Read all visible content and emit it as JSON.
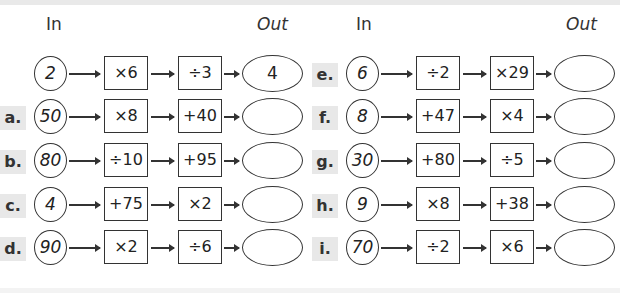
{
  "headers": {
    "left_in": "In",
    "left_out": "Out",
    "right_in": "In",
    "right_out": "Out"
  },
  "rows": {
    "example": {
      "label": "",
      "input": "2",
      "op1": "×6",
      "op2": "÷3",
      "output": "4"
    },
    "a": {
      "label": "a.",
      "input": "50",
      "op1": "×8",
      "op2": "+40",
      "output": ""
    },
    "b": {
      "label": "b.",
      "input": "80",
      "op1": "÷10",
      "op2": "+95",
      "output": ""
    },
    "c": {
      "label": "c.",
      "input": "4",
      "op1": "+75",
      "op2": "×2",
      "output": ""
    },
    "d": {
      "label": "d.",
      "input": "90",
      "op1": "×2",
      "op2": "÷6",
      "output": ""
    },
    "e": {
      "label": "e.",
      "input": "6",
      "op1": "÷2",
      "op2": "×29",
      "output": ""
    },
    "f": {
      "label": "f.",
      "input": "8",
      "op1": "+47",
      "op2": "×4",
      "output": ""
    },
    "g": {
      "label": "g.",
      "input": "30",
      "op1": "+80",
      "op2": "÷5",
      "output": ""
    },
    "h": {
      "label": "h.",
      "input": "9",
      "op1": "×8",
      "op2": "+38",
      "output": ""
    },
    "i": {
      "label": "i.",
      "input": "70",
      "op1": "÷2",
      "op2": "×6",
      "output": ""
    }
  }
}
